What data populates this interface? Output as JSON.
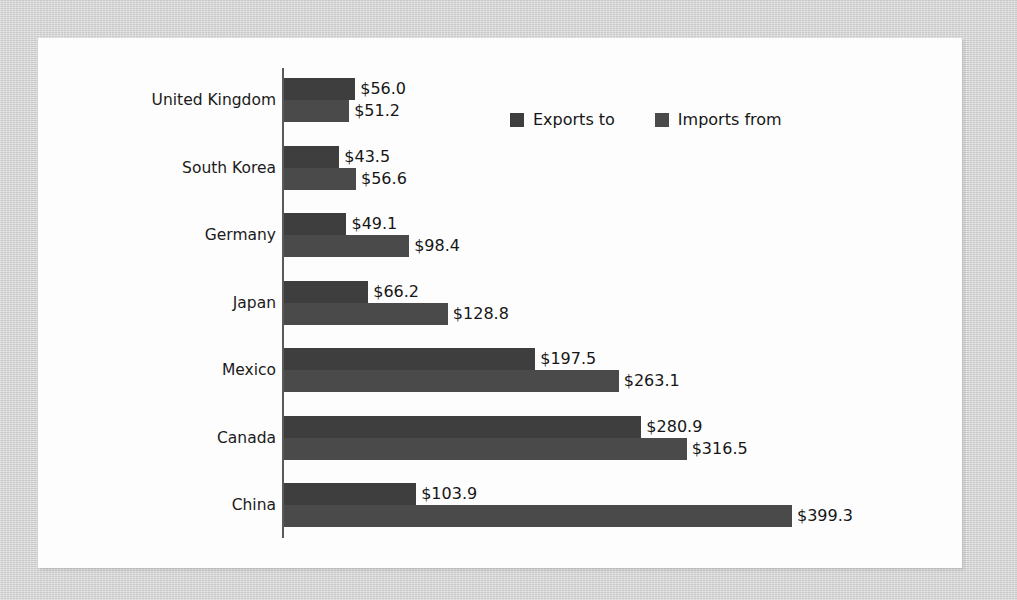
{
  "chart_data": {
    "type": "bar",
    "orientation": "horizontal",
    "title": "",
    "subtitle": "",
    "xlabel": "",
    "ylabel": "",
    "grid": false,
    "legend_position": "top-center",
    "axis_origin": 0,
    "xlim": [
      0,
      399.3
    ],
    "value_prefix": "$",
    "categories": [
      "United Kingdom",
      "South Korea",
      "Germany",
      "Japan",
      "Mexico",
      "Canada",
      "China"
    ],
    "series": [
      {
        "name": "Exports to",
        "color": "#3e3e3e",
        "values": [
          56.0,
          43.5,
          49.1,
          66.2,
          197.5,
          280.9,
          103.9
        ],
        "labels": [
          "$56.0",
          "$43.5",
          "$49.1",
          "$66.2",
          "$197.5",
          "$280.9",
          "$103.9"
        ]
      },
      {
        "name": "Imports from",
        "color": "#4a4a4a",
        "values": [
          51.2,
          56.6,
          98.4,
          128.8,
          263.1,
          316.5,
          399.3
        ],
        "labels": [
          "$51.2",
          "$56.6",
          "$98.4",
          "$128.8",
          "$263.1",
          "$316.5",
          "$399.3"
        ]
      }
    ]
  },
  "legend": {
    "items": [
      {
        "label": "Exports to",
        "swatch": "exports-swatch"
      },
      {
        "label": "Imports from",
        "swatch": "imports-swatch"
      }
    ]
  }
}
